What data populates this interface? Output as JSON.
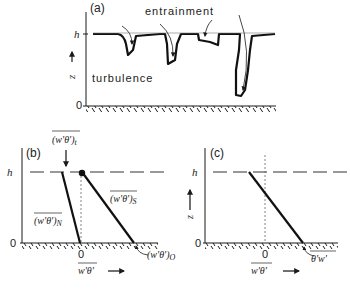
{
  "panels": {
    "a": {
      "label": "(a)",
      "y_top": "h",
      "y_bottom": "0",
      "y_axis": "z",
      "annotation_top": "entrainment",
      "annotation_body": "turbulence"
    },
    "b": {
      "label": "(b)",
      "y_top": "h",
      "y_bottom": "0",
      "x_zero": "0",
      "x_axis": "w'θ'",
      "flux_top": "(w'θ')",
      "flux_top_sub": "t",
      "flux_n": "(w'θ')",
      "flux_n_sub": "N",
      "flux_s": "(w'θ')",
      "flux_s_sub": "S",
      "flux_surface": "(w'θ')",
      "flux_surface_sub": "O"
    },
    "c": {
      "label": "(c)",
      "y_top": "h",
      "y_bottom": "0",
      "y_axis": "z",
      "x_zero": "0",
      "x_axis": "w'θ'",
      "flux_surface": "θ'w'"
    }
  },
  "colors": {
    "ink": "#1a1a1a",
    "background": "#ffffff"
  }
}
